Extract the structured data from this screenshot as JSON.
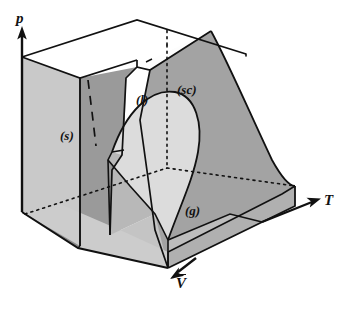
{
  "figure": {
    "kind": "three-dimensional-phase-surface"
  },
  "axes": {
    "pressure": {
      "label": "p",
      "icon": "axis-arrow-up-icon"
    },
    "temperature": {
      "label": "T",
      "icon": "axis-arrow-right-icon"
    },
    "molar_volume": {
      "label": "V",
      "overbar": true,
      "icon": "axis-arrow-down-left-icon"
    }
  },
  "regions": [
    {
      "id": "solid",
      "label": "(s)"
    },
    {
      "id": "liquid",
      "label": "(l)"
    },
    {
      "id": "supercritical",
      "label": "(sc)"
    },
    {
      "id": "gas",
      "label": "(g)"
    }
  ],
  "colors": {
    "ink": "#111111",
    "surface_back_dark": "#9a9a9a",
    "surface_mid": "#b4b4b4",
    "surface_light": "#c9c9c9",
    "surface_dome": "#dcdcdc",
    "surface_top_white": "#fdfdfd",
    "background": "#ffffff"
  },
  "line_styles": {
    "solid_edge": "solid",
    "hidden_edge": "dotted",
    "isotherm_break": "dashed"
  }
}
